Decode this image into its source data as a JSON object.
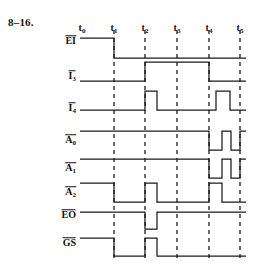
{
  "figure": {
    "problem_number": "8–16.",
    "type": "timing-diagram",
    "width": 259,
    "height": 270,
    "line_color": "#1a1a1a",
    "background": "#ffffff"
  },
  "time_axis": {
    "labels": [
      "t",
      "t",
      "t",
      "t",
      "t",
      "t"
    ],
    "subscripts": [
      "0",
      "1",
      "2",
      "3",
      "4",
      "5"
    ],
    "markers": [
      {
        "name": "t0",
        "base": "t",
        "sub": "0",
        "x": 82
      },
      {
        "name": "t1",
        "base": "t",
        "sub": "1",
        "x": 114
      },
      {
        "name": "t2",
        "base": "t",
        "sub": "2",
        "x": 145
      },
      {
        "name": "t3",
        "base": "t",
        "sub": "3",
        "x": 177
      },
      {
        "name": "t4",
        "base": "t",
        "sub": "4",
        "x": 209
      },
      {
        "name": "t5",
        "base": "t",
        "sub": "5",
        "x": 240
      }
    ],
    "dashed_marker_indices": [
      1,
      2,
      3,
      4,
      5
    ],
    "label_y": 22,
    "line_top": 30,
    "line_bottom": 262
  },
  "signals": [
    {
      "name": "EI",
      "base": "EI",
      "sub": "",
      "overbar": true,
      "label_x": 76,
      "label_y": 41,
      "high_y": 38,
      "low_y": 58,
      "start_x": 80,
      "end_x": 246,
      "transitions": [
        {
          "x": 114,
          "to": "low"
        }
      ],
      "initial": "high",
      "description": "high from t0, falls low at t1, stays low"
    },
    {
      "name": "I3",
      "base": "I",
      "sub": "3",
      "overbar": true,
      "label_x": 76,
      "label_y": 76,
      "high_y": 62,
      "low_y": 81,
      "start_x": 80,
      "end_x": 246,
      "transitions": [
        {
          "x": 145,
          "to": "high"
        },
        {
          "x": 209,
          "to": "low"
        }
      ],
      "initial": "low",
      "description": "low until t2, high from t2 to t4, low after t4"
    },
    {
      "name": "I4",
      "base": "I",
      "sub": "4",
      "overbar": true,
      "label_x": 76,
      "label_y": 108,
      "high_y": 91,
      "low_y": 110,
      "start_x": 80,
      "end_x": 246,
      "transitions": [
        {
          "x": 145,
          "to": "high"
        },
        {
          "x": 157,
          "to": "low"
        },
        {
          "x": 216,
          "to": "high"
        },
        {
          "x": 230,
          "to": "low"
        }
      ],
      "initial": "low",
      "description": "low with narrow high pulse at t2 and a second pulse between t4 and t5"
    },
    {
      "name": "A0",
      "base": "A",
      "sub": "0",
      "overbar": true,
      "label_x": 76,
      "label_y": 140,
      "high_y": 131,
      "low_y": 150,
      "start_x": 80,
      "end_x": 246,
      "transitions": [
        {
          "x": 209,
          "to": "low"
        },
        {
          "x": 222,
          "to": "high"
        },
        {
          "x": 231,
          "to": "low"
        },
        {
          "x": 240,
          "to": "high"
        }
      ],
      "initial": "high",
      "description": "high throughout with narrow low dips after t4"
    },
    {
      "name": "A1",
      "base": "A",
      "sub": "1",
      "overbar": true,
      "label_x": 76,
      "label_y": 168,
      "high_y": 159,
      "low_y": 178,
      "start_x": 80,
      "end_x": 246,
      "transitions": [
        {
          "x": 209,
          "to": "low"
        },
        {
          "x": 222,
          "to": "high"
        },
        {
          "x": 231,
          "to": "low"
        },
        {
          "x": 240,
          "to": "high"
        }
      ],
      "initial": "high",
      "description": "high throughout with narrow low dips after t4"
    },
    {
      "name": "A2",
      "base": "A",
      "sub": "2",
      "overbar": true,
      "label_x": 76,
      "label_y": 192,
      "high_y": 183,
      "low_y": 202,
      "start_x": 80,
      "end_x": 246,
      "transitions": [
        {
          "x": 114,
          "to": "low"
        },
        {
          "x": 145,
          "to": "high"
        },
        {
          "x": 157,
          "to": "low"
        },
        {
          "x": 209,
          "to": "high"
        },
        {
          "x": 222,
          "to": "low"
        }
      ],
      "initial": "high",
      "description": "high, falls at t1, pulses high at t2, low, pulses high at t4"
    },
    {
      "name": "EO",
      "base": "EO",
      "sub": "",
      "overbar": true,
      "label_x": 76,
      "label_y": 215,
      "high_y": 212,
      "low_y": 229,
      "start_x": 80,
      "end_x": 246,
      "transitions": [
        {
          "x": 145,
          "to": "low"
        },
        {
          "x": 157,
          "to": "high"
        }
      ],
      "initial": "high",
      "description": "high with a narrow low dip at t2"
    },
    {
      "name": "GS",
      "base": "GS",
      "sub": "",
      "overbar": true,
      "label_x": 76,
      "label_y": 243,
      "high_y": 238,
      "low_y": 256,
      "start_x": 80,
      "end_x": 246,
      "transitions": [
        {
          "x": 114,
          "to": "low"
        },
        {
          "x": 145,
          "to": "high"
        },
        {
          "x": 157,
          "to": "low"
        }
      ],
      "initial": "high",
      "description": "high until t1, low, narrow high pulse at t2, then low"
    }
  ]
}
